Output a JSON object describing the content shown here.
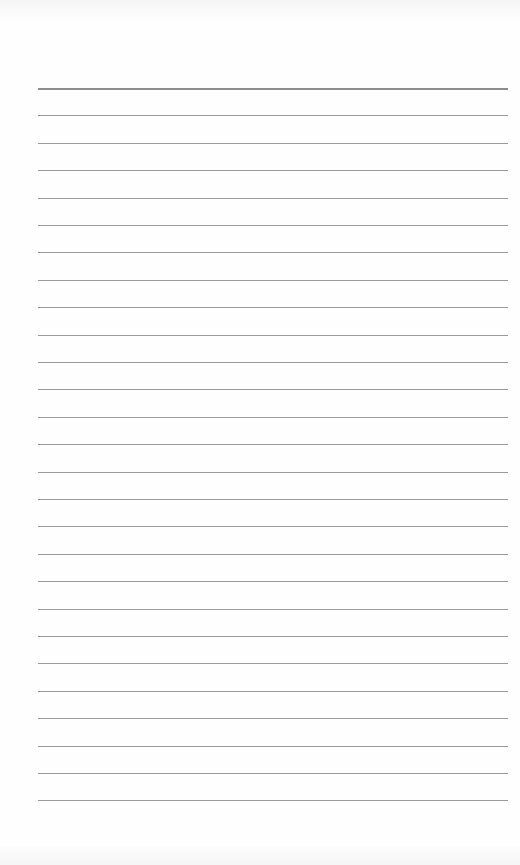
{
  "page": {
    "type": "blank ruled paper",
    "line_count": 27,
    "first_line_y": 88,
    "line_spacing": 27.4,
    "line_left": 38,
    "line_width": 470,
    "colors": {
      "paper": "#fefefe",
      "rule": "#9a9a9a",
      "header_rule": "#8c8c8c"
    }
  }
}
